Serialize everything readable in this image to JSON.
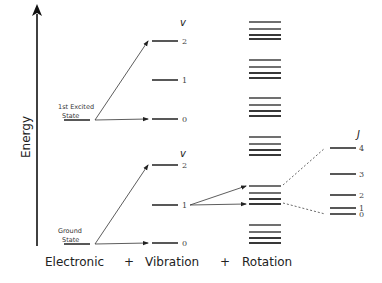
{
  "axis": {
    "label": "Energy",
    "x": 37,
    "y_top": 14,
    "y_bottom": 246
  },
  "bottom_labels": [
    {
      "text": "Electronic",
      "x": 45
    },
    {
      "text": "+",
      "x": 124
    },
    {
      "text": "Vibration",
      "x": 145
    },
    {
      "text": "+",
      "x": 220
    },
    {
      "text": "Rotation",
      "x": 242
    }
  ],
  "electronic_states": [
    {
      "name": "1st Excited State",
      "line1": "1st Excited",
      "line2": "State",
      "y": 120
    },
    {
      "name": "Ground State",
      "line1": "Ground",
      "line2": "State",
      "y": 244
    }
  ],
  "vibration": {
    "symbol": "v",
    "groups": [
      {
        "symbol_y": 26,
        "levels": [
          {
            "v": "2",
            "y": 41
          },
          {
            "v": "1",
            "y": 80
          },
          {
            "v": "0",
            "y": 119
          }
        ]
      },
      {
        "symbol_y": 157,
        "levels": [
          {
            "v": "2",
            "y": 165
          },
          {
            "v": "1",
            "y": 205
          },
          {
            "v": "0",
            "y": 243
          }
        ]
      }
    ]
  },
  "rotation": {
    "x1": 249,
    "x2": 281,
    "groups": [
      [
        22,
        29,
        35,
        39
      ],
      [
        60,
        67,
        73,
        78
      ],
      [
        98,
        105,
        111,
        116
      ],
      [
        137,
        144,
        150,
        155
      ],
      [
        186,
        193,
        199,
        204
      ],
      [
        225,
        232,
        238,
        243
      ]
    ]
  },
  "rotational_detail": {
    "symbol": "J",
    "levels": [
      {
        "j": "4",
        "y": 148
      },
      {
        "j": "3",
        "y": 174
      },
      {
        "j": "2",
        "y": 195
      },
      {
        "j": "1",
        "y": 208
      },
      {
        "j": "0",
        "y": 214
      }
    ]
  }
}
